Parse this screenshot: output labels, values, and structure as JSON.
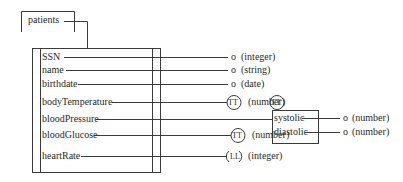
{
  "diagram": {
    "root": {
      "label": "patients"
    },
    "fields": [
      {
        "name": "SSN",
        "kind": "o",
        "type": "(integer)"
      },
      {
        "name": "name",
        "kind": "o",
        "type": "(string)"
      },
      {
        "name": "birthdate",
        "kind": "o",
        "type": "(date)"
      },
      {
        "name": "bodyTemperature",
        "kind": "TT",
        "type": "(number)"
      },
      {
        "name": "bloodPressure",
        "kind": "TT",
        "type": ""
      },
      {
        "name": "bloodGlucose",
        "kind": "TT",
        "type": "(number)"
      },
      {
        "name": "heartRate",
        "kind": "LL",
        "type": "(integer)"
      }
    ],
    "bloodPressure_struct": {
      "marker": "TT",
      "fields": [
        {
          "name": "systolic",
          "kind": "o",
          "type": "(number)"
        },
        {
          "name": "diastolic",
          "kind": "o",
          "type": "(number)"
        }
      ]
    }
  },
  "colors": {
    "line": "#3a3a3a",
    "text": "#2a2a2a",
    "background": "#ffffff"
  }
}
